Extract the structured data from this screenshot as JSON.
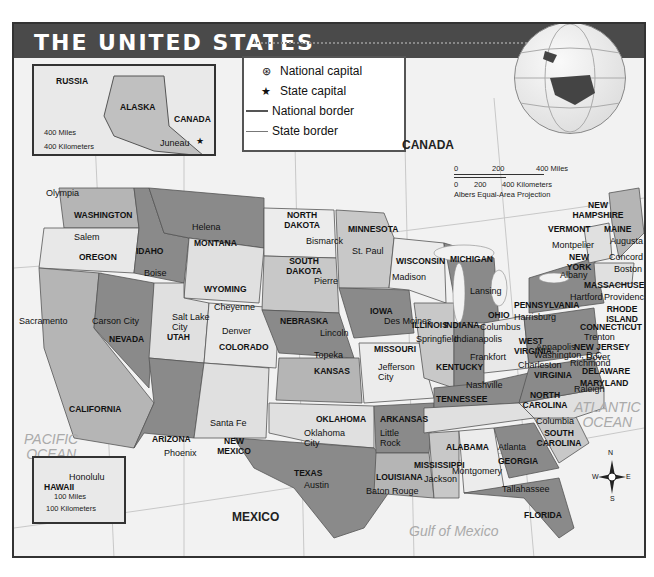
{
  "title": "THE UNITED STATES",
  "legend": {
    "items": [
      {
        "symbol": "national-capital-icon",
        "glyph": "⊛",
        "label": "National capital"
      },
      {
        "symbol": "state-capital-icon",
        "glyph": "★",
        "label": "State capital"
      },
      {
        "symbol": "national-border-line",
        "label": "National border"
      },
      {
        "symbol": "state-border-line",
        "label": "State border"
      }
    ]
  },
  "scale": {
    "miles": [
      "0",
      "200",
      "400 Miles"
    ],
    "kilometers": [
      "0",
      "200",
      "400 Kilometers"
    ],
    "projection": "Albers Equal-Area Projection"
  },
  "countries": {
    "canada": "CANADA",
    "mexico": "MEXICO",
    "russia": "RUSSIA",
    "canada_inset": "CANADA"
  },
  "oceans": {
    "pacific": "PACIFIC\nOCEAN",
    "atlantic": "ATLANTIC\nOCEAN",
    "gulf": "Gulf of Mexico",
    "arctic_inset": "ARCTIC OCEAN",
    "pacific_inset_alaska": "PACIFIC OCEAN",
    "pacific_inset_hawaii": "PACIFIC OCEAN"
  },
  "alaska_inset": {
    "state": "ALASKA",
    "capital": "Juneau",
    "scale_miles": [
      "0",
      "200",
      "400 Miles"
    ],
    "scale_km": [
      "0",
      "400 Kilometers"
    ],
    "meridians": [
      "180°",
      "170°W",
      "160°W",
      "150°W",
      "140°W"
    ],
    "parallels": [
      "65°N",
      "60°N",
      "55°N"
    ]
  },
  "hawaii_inset": {
    "state": "HAWAII",
    "capital": "Honolulu",
    "scale_miles": [
      "0",
      "100 Miles"
    ],
    "scale_km": [
      "0",
      "100 Kilometers"
    ],
    "meridians": [
      "160°W",
      "155°W"
    ]
  },
  "graticule": {
    "meridians": [
      "120°W",
      "110°W",
      "100°W",
      "90°W",
      "80°W",
      "70°W"
    ],
    "parallels": [
      "40°N",
      "30°N"
    ]
  },
  "rivers": [
    "Columbia",
    "Colorado",
    "Rio Grande",
    "Mississippi",
    "Ohio"
  ],
  "lakes": [
    "Lake Superior",
    "Lake Michigan",
    "Lake Huron",
    "Lake Ontario"
  ],
  "states": [
    {
      "name": "WASHINGTON",
      "capital": "Olympia"
    },
    {
      "name": "OREGON",
      "capital": "Salem"
    },
    {
      "name": "CALIFORNIA",
      "capital": "Sacramento"
    },
    {
      "name": "NEVADA",
      "capital": "Carson City"
    },
    {
      "name": "IDAHO",
      "capital": "Boise"
    },
    {
      "name": "MONTANA",
      "capital": "Helena"
    },
    {
      "name": "WYOMING",
      "capital": "Cheyenne"
    },
    {
      "name": "UTAH",
      "capital": "Salt Lake City"
    },
    {
      "name": "COLORADO",
      "capital": "Denver"
    },
    {
      "name": "ARIZONA",
      "capital": "Phoenix"
    },
    {
      "name": "NEW MEXICO",
      "capital": "Santa Fe"
    },
    {
      "name": "NORTH DAKOTA",
      "capital": "Bismarck"
    },
    {
      "name": "SOUTH DAKOTA",
      "capital": "Pierre"
    },
    {
      "name": "NEBRASKA",
      "capital": "Lincoln"
    },
    {
      "name": "KANSAS",
      "capital": "Topeka"
    },
    {
      "name": "OKLAHOMA",
      "capital": "Oklahoma City"
    },
    {
      "name": "TEXAS",
      "capital": "Austin"
    },
    {
      "name": "MINNESOTA",
      "capital": "St. Paul"
    },
    {
      "name": "IOWA",
      "capital": "Des Moines"
    },
    {
      "name": "MISSOURI",
      "capital": "Jefferson City"
    },
    {
      "name": "ARKANSAS",
      "capital": "Little Rock"
    },
    {
      "name": "LOUISIANA",
      "capital": "Baton Rouge"
    },
    {
      "name": "WISCONSIN",
      "capital": "Madison"
    },
    {
      "name": "ILLINOIS",
      "capital": "Springfield"
    },
    {
      "name": "MICHIGAN",
      "capital": "Lansing"
    },
    {
      "name": "INDIANA",
      "capital": "Indianapolis"
    },
    {
      "name": "OHIO",
      "capital": "Columbus"
    },
    {
      "name": "KENTUCKY",
      "capital": "Frankfort"
    },
    {
      "name": "TENNESSEE",
      "capital": "Nashville"
    },
    {
      "name": "MISSISSIPPI",
      "capital": "Jackson"
    },
    {
      "name": "ALABAMA",
      "capital": "Montgomery"
    },
    {
      "name": "GEORGIA",
      "capital": "Atlanta"
    },
    {
      "name": "FLORIDA",
      "capital": "Tallahassee"
    },
    {
      "name": "SOUTH CAROLINA",
      "capital": "Columbia"
    },
    {
      "name": "NORTH CAROLINA",
      "capital": "Raleigh"
    },
    {
      "name": "VIRGINIA",
      "capital": "Richmond"
    },
    {
      "name": "WEST VIRGINIA",
      "capital": "Charleston"
    },
    {
      "name": "PENNSYLVANIA",
      "capital": "Harrisburg"
    },
    {
      "name": "NEW YORK",
      "capital": "Albany"
    },
    {
      "name": "VERMONT",
      "capital": "Montpelier"
    },
    {
      "name": "NEW HAMPSHIRE",
      "capital": "Concord"
    },
    {
      "name": "MAINE",
      "capital": "Augusta"
    },
    {
      "name": "MASSACHUSETTS",
      "capital": "Boston"
    },
    {
      "name": "RHODE ISLAND",
      "capital": "Providence"
    },
    {
      "name": "CONNECTICUT",
      "capital": "Hartford"
    },
    {
      "name": "NEW JERSEY",
      "capital": "Trenton"
    },
    {
      "name": "DELAWARE",
      "capital": "Dover"
    },
    {
      "name": "MARYLAND",
      "capital": "Annapolis"
    }
  ],
  "national_capital": "Washington, D.C.",
  "compass": {
    "n": "N",
    "s": "S",
    "e": "E",
    "w": "W"
  },
  "colors": {
    "title_bar": "#4a4a4a",
    "dark_state": "#8a8a8a",
    "mid_state": "#b5b5b5",
    "light_state": "#e0e0e0",
    "water": "#f2f2f2"
  }
}
